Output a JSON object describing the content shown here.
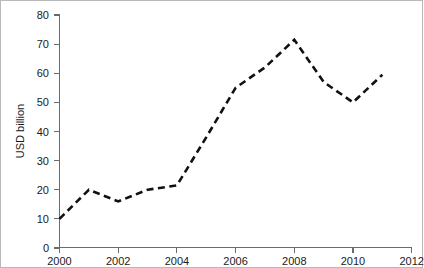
{
  "chart_data": {
    "type": "line",
    "title": "",
    "xlabel": "",
    "ylabel": "USD billion",
    "x": [
      2000,
      2001,
      2002,
      2003,
      2004,
      2005,
      2006,
      2007,
      2008,
      2009,
      2010,
      2011
    ],
    "values": [
      10,
      20,
      16,
      20,
      21.5,
      38,
      55,
      62,
      71.5,
      57,
      50,
      59.5
    ],
    "series": [
      {
        "name": "USD billion",
        "values": [
          10,
          20,
          16,
          20,
          21.5,
          38,
          55,
          62,
          71.5,
          57,
          50,
          59.5
        ]
      }
    ],
    "xlim": [
      2000,
      2012
    ],
    "ylim": [
      0,
      80
    ],
    "xticks": [
      2000,
      2002,
      2004,
      2006,
      2008,
      2010,
      2012
    ],
    "xtick_labels": [
      "2000",
      "2002",
      "2004",
      "2006",
      "2008",
      "2010",
      "2012"
    ],
    "yticks": [
      0,
      10,
      20,
      30,
      40,
      50,
      60,
      70,
      80
    ],
    "ytick_labels": [
      "0",
      "10",
      "20",
      "30",
      "40",
      "50",
      "60",
      "70",
      "80"
    ],
    "grid": false,
    "legend": false,
    "legend_position": "none",
    "line_style": "dashed",
    "line_color": "#111111",
    "axis_color": "#6b6b6b",
    "background_color": "#ffffff",
    "border_color": "#b9b9b9"
  }
}
